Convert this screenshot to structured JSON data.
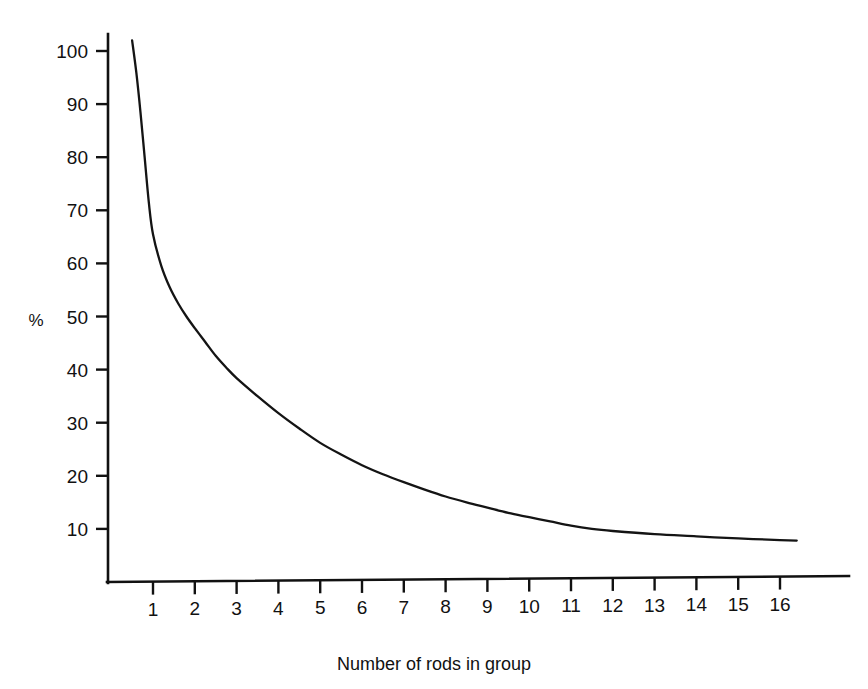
{
  "chart_data": {
    "type": "line",
    "title": "",
    "subtitle": "",
    "xlabel": "Number of rods in group",
    "ylabel": "%",
    "xlim": [
      0.3,
      16.6
    ],
    "ylim": [
      0,
      107
    ],
    "grid": false,
    "legend": false,
    "legend_position": "none",
    "xticks": [
      1,
      2,
      3,
      4,
      5,
      6,
      7,
      8,
      9,
      10,
      11,
      12,
      13,
      14,
      15,
      16
    ],
    "xtick_labels": [
      "1",
      "2",
      "3",
      "4",
      "5",
      "6",
      "7",
      "8",
      "9",
      "10",
      "11",
      "12",
      "13",
      "14",
      "15",
      "16"
    ],
    "yticks": [
      10,
      20,
      30,
      40,
      50,
      60,
      70,
      80,
      90,
      100
    ],
    "ytick_labels": [
      "10",
      "20",
      "30",
      "40",
      "50",
      "60",
      "70",
      "80",
      "90",
      "100"
    ],
    "series": [
      {
        "name": "percentage",
        "color": "#141414",
        "x": [
          0.5,
          0.6,
          0.7,
          0.8,
          0.9,
          1.0,
          1.2,
          1.4,
          1.6,
          1.8,
          2.0,
          2.25,
          2.5,
          2.75,
          3.0,
          3.5,
          4.0,
          4.5,
          5.0,
          5.5,
          6.0,
          6.5,
          7.0,
          7.5,
          8.0,
          8.5,
          9.0,
          9.5,
          10.0,
          10.5,
          11.0,
          11.5,
          12.0,
          13.0,
          14.0,
          15.0,
          16.0,
          16.4
        ],
        "y": [
          102.0,
          96.0,
          88.5,
          80.0,
          71.5,
          65.5,
          59.5,
          55.5,
          52.5,
          50.0,
          47.8,
          45.2,
          42.6,
          40.4,
          38.4,
          35.0,
          31.8,
          28.9,
          26.2,
          24.0,
          22.0,
          20.3,
          18.8,
          17.4,
          16.1,
          15.0,
          14.0,
          13.0,
          12.2,
          11.4,
          10.6,
          10.0,
          9.6,
          9.0,
          8.6,
          8.2,
          7.9,
          7.8
        ]
      }
    ]
  },
  "axis": {
    "y_label": "%",
    "x_title": "Number of rods in group"
  }
}
